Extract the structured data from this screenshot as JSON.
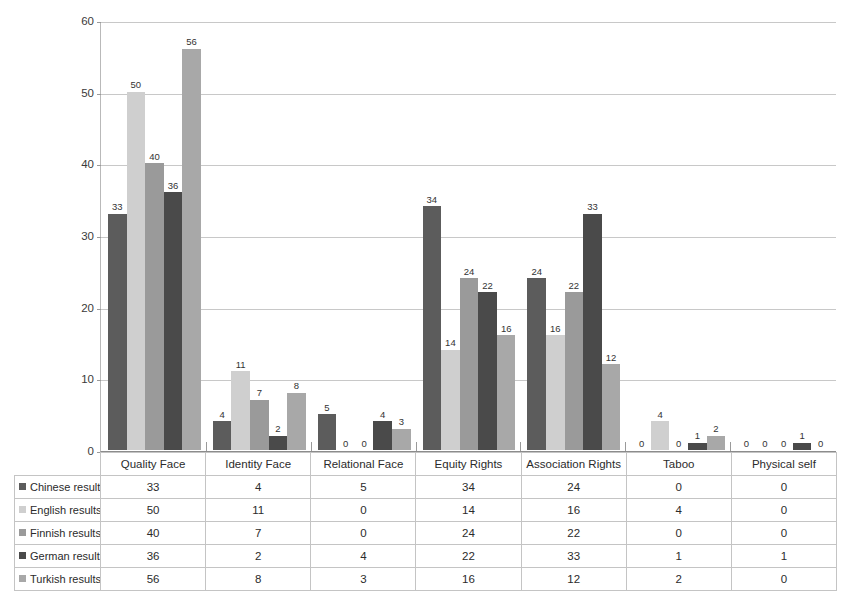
{
  "chart_data": {
    "type": "bar",
    "title": "",
    "subtitle": "",
    "xlabel": "",
    "ylabel": "",
    "ylim": [
      0,
      60
    ],
    "yticks": [
      0,
      10,
      20,
      30,
      40,
      50,
      60
    ],
    "grid": true,
    "legend_position": "data-table-row-headers",
    "show_data_labels": true,
    "data_table_visible": true,
    "categories": [
      "Quality Face",
      "Identity Face",
      "Relational Face",
      "Equity Rights",
      "Association Rights",
      "Taboo",
      "Physical self"
    ],
    "series": [
      {
        "name": "Chinese results",
        "color": "#5c5c5c",
        "values": [
          33,
          4,
          5,
          34,
          24,
          0,
          0
        ]
      },
      {
        "name": "English results",
        "color": "#cfcfcf",
        "values": [
          50,
          11,
          0,
          14,
          16,
          4,
          0
        ]
      },
      {
        "name": "Finnish results",
        "color": "#9a9a9a",
        "values": [
          40,
          7,
          0,
          24,
          22,
          0,
          0
        ]
      },
      {
        "name": "German results",
        "color": "#4a4a4a",
        "values": [
          36,
          2,
          4,
          22,
          33,
          1,
          1
        ]
      },
      {
        "name": "Turkish results",
        "color": "#a8a8a8",
        "values": [
          56,
          8,
          3,
          16,
          12,
          2,
          0
        ]
      }
    ]
  },
  "table": {
    "corner_label": "",
    "column_headers": [
      "Quality Face",
      "Identity Face",
      "Relational Face",
      "Equity Rights",
      "Association Rights",
      "Taboo",
      "Physical self"
    ],
    "rows": [
      {
        "label": "Chinese results",
        "color": "#5c5c5c",
        "cells": [
          "33",
          "4",
          "5",
          "34",
          "24",
          "0",
          "0"
        ]
      },
      {
        "label": "English results",
        "color": "#cfcfcf",
        "cells": [
          "50",
          "11",
          "0",
          "14",
          "16",
          "4",
          "0"
        ]
      },
      {
        "label": "Finnish results",
        "color": "#9a9a9a",
        "cells": [
          "40",
          "7",
          "0",
          "24",
          "22",
          "0",
          "0"
        ]
      },
      {
        "label": "German results",
        "color": "#4a4a4a",
        "cells": [
          "36",
          "2",
          "4",
          "22",
          "33",
          "1",
          "1"
        ]
      },
      {
        "label": "Turkish results",
        "color": "#a8a8a8",
        "cells": [
          "56",
          "8",
          "3",
          "16",
          "12",
          "2",
          "0"
        ]
      }
    ]
  },
  "axis": {
    "y_tick_labels": [
      "0",
      "10",
      "20",
      "30",
      "40",
      "50",
      "60"
    ]
  },
  "colors": {
    "gridline": "#c8c8c8",
    "axis": "#8c8c8c",
    "table_border": "#c4c4c4",
    "text": "#2b2b2b",
    "background": "#ffffff"
  }
}
